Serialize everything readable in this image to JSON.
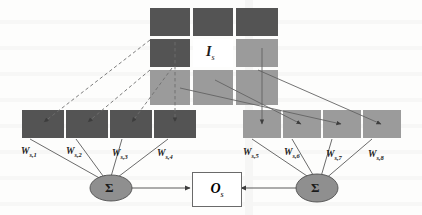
{
  "diagram": {
    "type": "neural-network-schematic",
    "colors": {
      "dark_gray": "#545454",
      "light_gray": "#9b9b9b",
      "white_cell": "#ffffff",
      "cell_border": "#ffffff",
      "line": "#4a4a4a",
      "node_fill": "#8f8f8f",
      "node_stroke": "#4a4a4a",
      "box_stroke": "#6a6a6a",
      "background": "#fdfdfc"
    },
    "input_grid": {
      "label": "I",
      "label_sub": "s",
      "rows": 3,
      "cols": 3,
      "cell_shades": [
        [
          "dark",
          "dark",
          "dark"
        ],
        [
          "dark",
          "white",
          "light"
        ],
        [
          "light",
          "light",
          "light"
        ]
      ]
    },
    "left_feature_maps": {
      "shade": "dark",
      "count": 4,
      "weights": [
        {
          "base": "W",
          "sub": "s,1"
        },
        {
          "base": "W",
          "sub": "s,2"
        },
        {
          "base": "W",
          "sub": "s,3"
        },
        {
          "base": "W",
          "sub": "s,4"
        }
      ]
    },
    "right_feature_maps": {
      "shade": "light",
      "count": 4,
      "weights": [
        {
          "base": "W",
          "sub": "s,5"
        },
        {
          "base": "W",
          "sub": "s,6"
        },
        {
          "base": "W",
          "sub": "s,7"
        },
        {
          "base": "W",
          "sub": "s,8"
        }
      ]
    },
    "sum_nodes": [
      {
        "name": "left-sum",
        "symbol": "Σ"
      },
      {
        "name": "right-sum",
        "symbol": "Σ"
      }
    ],
    "output": {
      "label": "O",
      "label_sub": "s"
    },
    "edges": {
      "left_style": "dashed",
      "right_style": "solid"
    }
  }
}
